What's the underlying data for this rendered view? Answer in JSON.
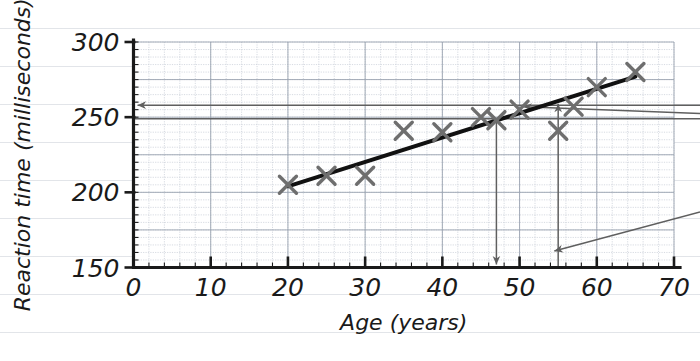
{
  "chart_data": {
    "type": "scatter",
    "title": "",
    "xlabel": "Age (years)",
    "ylabel": "Reaction time (milliseconds)",
    "xlim": [
      0,
      70
    ],
    "ylim": [
      150,
      300
    ],
    "xticks": [
      0,
      10,
      20,
      30,
      40,
      50,
      60,
      70
    ],
    "yticks": [
      150,
      200,
      250,
      300
    ],
    "xtick_labels": [
      "0",
      "10",
      "20",
      "30",
      "40",
      "50",
      "60",
      "70"
    ],
    "ytick_labels": [
      "150",
      "200",
      "250",
      "300"
    ],
    "grid": "minor grid, 2 years by 5 ms",
    "minor_x_step": 2,
    "minor_y_step": 5,
    "legend": "none",
    "points": [
      {
        "x": 20,
        "y": 205
      },
      {
        "x": 25,
        "y": 211
      },
      {
        "x": 30,
        "y": 211
      },
      {
        "x": 35,
        "y": 241
      },
      {
        "x": 40,
        "y": 240
      },
      {
        "x": 45,
        "y": 250
      },
      {
        "x": 47,
        "y": 248
      },
      {
        "x": 50,
        "y": 255
      },
      {
        "x": 55,
        "y": 241
      },
      {
        "x": 57,
        "y": 257
      },
      {
        "x": 60,
        "y": 270
      },
      {
        "x": 65,
        "y": 280
      }
    ],
    "trend_line": {
      "label": "line of best fit",
      "x_start": 20,
      "y_start": 204,
      "x_end": 65,
      "y_end": 277
    },
    "annotations": [
      {
        "name": "horizontal-reading-upper",
        "type": "horizontal-arrow-left",
        "y": 258,
        "x_from": 70,
        "x_to": 0,
        "note": "reading across to reaction-time axis"
      },
      {
        "name": "horizontal-reading-lower",
        "type": "horizontal-line",
        "y": 249,
        "x_from": 70,
        "x_to": 0,
        "note": "reading across to reaction-time axis"
      },
      {
        "name": "vertical-reading-down",
        "type": "vertical-arrow-down",
        "x": 47,
        "y_from": 248,
        "y_to": 150,
        "note": "reading down to age axis"
      },
      {
        "name": "vertical-reading-up",
        "type": "vertical-arrow-up",
        "x": 55,
        "y_from": 150,
        "y_to": 259,
        "note": "reading up from age axis"
      },
      {
        "name": "callout-pointer-upper",
        "type": "diagonal-arrow-left",
        "note": "pointer to line of best fit"
      },
      {
        "name": "callout-pointer-lower",
        "type": "diagonal-arrow-left",
        "note": "pointer from lower right into plot"
      }
    ]
  },
  "axes": {
    "x_title": "Age (years)",
    "y_title": "Reaction time (milliseconds)"
  },
  "colors": {
    "marker": "#6e6e6e",
    "trend": "#111111",
    "axis": "#1a1a1a",
    "grid_major": "#9aa3b0",
    "grid_minor": "#c6ccd6",
    "annotation": "#5f5f5f",
    "paper_rule": "#96a0af"
  }
}
